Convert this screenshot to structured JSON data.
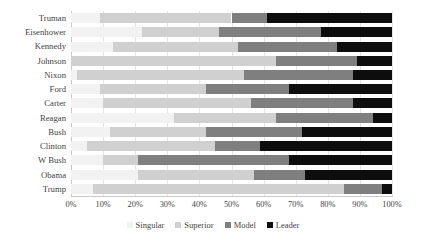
{
  "chart_data": {
    "type": "bar",
    "orientation": "horizontal",
    "stacked": true,
    "normalized_percent": true,
    "title": "",
    "xlabel": "",
    "ylabel": "",
    "xlim": [
      0,
      100
    ],
    "xtick_labels": [
      "0%",
      "10%",
      "20%",
      "30%",
      "40%",
      "50%",
      "60%",
      "70%",
      "80%",
      "90%",
      "100%"
    ],
    "xtick_values": [
      0,
      10,
      20,
      30,
      40,
      50,
      60,
      70,
      80,
      90,
      100
    ],
    "grid": "vertical",
    "legend_position": "bottom",
    "categories": [
      "Truman",
      "Eisenhower",
      "Kennedy",
      "Johnson",
      "Nixon",
      "Ford",
      "Carter",
      "Reagan",
      "Bush",
      "Clinton",
      "W Bush",
      "Obama",
      "Trump"
    ],
    "series": [
      {
        "name": "Singular",
        "color": "#f2f2f2",
        "values": [
          9,
          22,
          13,
          0,
          2,
          9,
          10,
          32,
          12,
          5,
          10,
          21,
          7
        ]
      },
      {
        "name": "Superior",
        "color": "#d0d0d0",
        "values": [
          41,
          24,
          39,
          64,
          52,
          33,
          46,
          32,
          30,
          40,
          11,
          36,
          78
        ]
      },
      {
        "name": "Model",
        "color": "#7f7f7f",
        "values": [
          11,
          32,
          31,
          25,
          34,
          26,
          32,
          30,
          30,
          14,
          47,
          16,
          12
        ]
      },
      {
        "name": "Leader",
        "color": "#0d0d0d",
        "values": [
          39,
          22,
          17,
          11,
          12,
          32,
          12,
          6,
          28,
          41,
          32,
          27,
          3
        ]
      }
    ]
  },
  "colors": {
    "singular": "#f2f2f2",
    "superior": "#d0d0d0",
    "model": "#7f7f7f",
    "leader": "#0d0d0d",
    "gridline": "#e4e4e4",
    "axis": "#c9c9c9",
    "text": "#3f3f3f",
    "background": "#ffffff"
  }
}
